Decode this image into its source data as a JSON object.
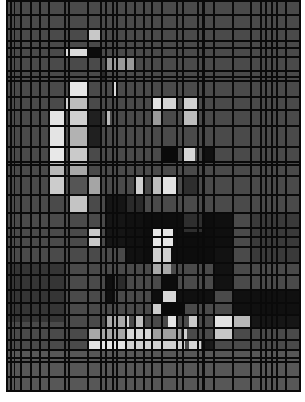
{
  "artwork": {
    "description": "Grayscale pixelated mosaic of a figure with an irregular black grid overlay",
    "background": "#4a4a4a",
    "grid_color": "#0a0a0a",
    "origin": [
      6,
      0
    ],
    "size": [
      295,
      392
    ],
    "vertical_lines": [
      {
        "x": 0,
        "w": 2
      },
      {
        "x": 4,
        "w": 2
      },
      {
        "x": 8,
        "w": 1
      },
      {
        "x": 14,
        "w": 2
      },
      {
        "x": 24,
        "w": 2
      },
      {
        "x": 33,
        "w": 2
      },
      {
        "x": 42,
        "w": 2
      },
      {
        "x": 58,
        "w": 2
      },
      {
        "x": 62,
        "w": 2
      },
      {
        "x": 81,
        "w": 2
      },
      {
        "x": 94,
        "w": 2
      },
      {
        "x": 99,
        "w": 2
      },
      {
        "x": 106,
        "w": 2
      },
      {
        "x": 110,
        "w": 2
      },
      {
        "x": 119,
        "w": 2
      },
      {
        "x": 128,
        "w": 2
      },
      {
        "x": 137,
        "w": 2
      },
      {
        "x": 145,
        "w": 2
      },
      {
        "x": 155,
        "w": 2
      },
      {
        "x": 170,
        "w": 2
      },
      {
        "x": 176,
        "w": 2
      },
      {
        "x": 191,
        "w": 2
      },
      {
        "x": 196,
        "w": 3
      },
      {
        "x": 207,
        "w": 2
      },
      {
        "x": 226,
        "w": 2
      },
      {
        "x": 244,
        "w": 2
      },
      {
        "x": 254,
        "w": 2
      },
      {
        "x": 259,
        "w": 2
      },
      {
        "x": 265,
        "w": 2
      },
      {
        "x": 270,
        "w": 2
      },
      {
        "x": 279,
        "w": 2
      },
      {
        "x": 293,
        "w": 2
      }
    ],
    "horizontal_lines": [
      {
        "y": 0,
        "h": 2
      },
      {
        "y": 14,
        "h": 2
      },
      {
        "y": 28,
        "h": 2
      },
      {
        "y": 40,
        "h": 2
      },
      {
        "y": 47,
        "h": 2
      },
      {
        "y": 56,
        "h": 2
      },
      {
        "y": 70,
        "h": 2
      },
      {
        "y": 76,
        "h": 2
      },
      {
        "y": 80,
        "h": 2
      },
      {
        "y": 96,
        "h": 2
      },
      {
        "y": 109,
        "h": 2
      },
      {
        "y": 125,
        "h": 2
      },
      {
        "y": 146,
        "h": 2
      },
      {
        "y": 161,
        "h": 2
      },
      {
        "y": 164,
        "h": 2
      },
      {
        "y": 175,
        "h": 2
      },
      {
        "y": 194,
        "h": 2
      },
      {
        "y": 212,
        "h": 2
      },
      {
        "y": 227,
        "h": 2
      },
      {
        "y": 236,
        "h": 2
      },
      {
        "y": 246,
        "h": 2
      },
      {
        "y": 262,
        "h": 2
      },
      {
        "y": 274,
        "h": 2
      },
      {
        "y": 289,
        "h": 2
      },
      {
        "y": 302,
        "h": 2
      },
      {
        "y": 314,
        "h": 2
      },
      {
        "y": 327,
        "h": 2
      },
      {
        "y": 339,
        "h": 2
      },
      {
        "y": 349,
        "h": 2
      },
      {
        "y": 357,
        "h": 2
      },
      {
        "y": 361,
        "h": 2
      },
      {
        "y": 376,
        "h": 2
      },
      {
        "y": 390,
        "h": 2
      }
    ],
    "blocks": [
      {
        "x": 82,
        "y": 28,
        "w": 12,
        "h": 12,
        "c": "#c8c8c8"
      },
      {
        "x": 58,
        "y": 47,
        "w": 24,
        "h": 9,
        "c": "#dcdcdc"
      },
      {
        "x": 82,
        "y": 47,
        "w": 12,
        "h": 9,
        "c": "#0c0c0c"
      },
      {
        "x": 99,
        "y": 58,
        "w": 30,
        "h": 12,
        "c": "#9a9a9a"
      },
      {
        "x": 94,
        "y": 70,
        "w": 5,
        "h": 10,
        "c": "#2a2a2a"
      },
      {
        "x": 64,
        "y": 80,
        "w": 17,
        "h": 16,
        "c": "#e6e6e6"
      },
      {
        "x": 58,
        "y": 96,
        "w": 6,
        "h": 13,
        "c": "#d0d0d0"
      },
      {
        "x": 64,
        "y": 96,
        "w": 17,
        "h": 13,
        "c": "#bdbdbd"
      },
      {
        "x": 106,
        "y": 80,
        "w": 5,
        "h": 16,
        "c": "#dadada"
      },
      {
        "x": 42,
        "y": 109,
        "w": 16,
        "h": 37,
        "c": "#e4e4e4"
      },
      {
        "x": 64,
        "y": 109,
        "w": 17,
        "h": 16,
        "c": "#cfcfcf"
      },
      {
        "x": 64,
        "y": 125,
        "w": 17,
        "h": 21,
        "c": "#b2b2b2"
      },
      {
        "x": 82,
        "y": 109,
        "w": 12,
        "h": 37,
        "c": "#202020"
      },
      {
        "x": 99,
        "y": 109,
        "w": 5,
        "h": 16,
        "c": "#bcbcbc"
      },
      {
        "x": 145,
        "y": 96,
        "w": 10,
        "h": 13,
        "c": "#e0e0e0"
      },
      {
        "x": 157,
        "y": 96,
        "w": 13,
        "h": 13,
        "c": "#d4d4d4"
      },
      {
        "x": 178,
        "y": 96,
        "w": 13,
        "h": 13,
        "c": "#cfcfcf"
      },
      {
        "x": 178,
        "y": 109,
        "w": 13,
        "h": 16,
        "c": "#bdbdbd"
      },
      {
        "x": 145,
        "y": 109,
        "w": 10,
        "h": 16,
        "c": "#9a9a9a"
      },
      {
        "x": 157,
        "y": 146,
        "w": 13,
        "h": 15,
        "c": "#0a0a0a"
      },
      {
        "x": 176,
        "y": 146,
        "w": 13,
        "h": 15,
        "c": "#d8d8d8"
      },
      {
        "x": 199,
        "y": 146,
        "w": 8,
        "h": 15,
        "c": "#111111"
      },
      {
        "x": 196,
        "y": 161,
        "w": 11,
        "h": 2,
        "c": "#e0e0e0"
      },
      {
        "x": 42,
        "y": 146,
        "w": 16,
        "h": 15,
        "c": "#e8e8e8"
      },
      {
        "x": 64,
        "y": 146,
        "w": 17,
        "h": 15,
        "c": "#cacaca"
      },
      {
        "x": 42,
        "y": 161,
        "w": 16,
        "h": 14,
        "c": "#b8b8b8"
      },
      {
        "x": 64,
        "y": 161,
        "w": 17,
        "h": 14,
        "c": "#a8a8a8"
      },
      {
        "x": 42,
        "y": 175,
        "w": 16,
        "h": 19,
        "c": "#cccccc"
      },
      {
        "x": 64,
        "y": 175,
        "w": 17,
        "h": 19,
        "c": "#555555"
      },
      {
        "x": 82,
        "y": 175,
        "w": 12,
        "h": 19,
        "c": "#a5a5a5"
      },
      {
        "x": 128,
        "y": 175,
        "w": 9,
        "h": 19,
        "c": "#d0d0d0"
      },
      {
        "x": 147,
        "y": 175,
        "w": 8,
        "h": 19,
        "c": "#bdbdbd"
      },
      {
        "x": 157,
        "y": 175,
        "w": 13,
        "h": 19,
        "c": "#e2e2e2"
      },
      {
        "x": 64,
        "y": 194,
        "w": 17,
        "h": 18,
        "c": "#c4c4c4"
      },
      {
        "x": 99,
        "y": 194,
        "w": 20,
        "h": 52,
        "c": "#151515"
      },
      {
        "x": 119,
        "y": 194,
        "w": 18,
        "h": 18,
        "c": "#2a2a2a"
      },
      {
        "x": 178,
        "y": 175,
        "w": 13,
        "h": 20,
        "c": "#2e2e2e"
      },
      {
        "x": 0,
        "y": 212,
        "w": 295,
        "h": 0,
        "c": "#4a4a4a"
      },
      {
        "x": 82,
        "y": 227,
        "w": 12,
        "h": 19,
        "c": "#c9c9c9"
      },
      {
        "x": 119,
        "y": 212,
        "w": 18,
        "h": 50,
        "c": "#111111"
      },
      {
        "x": 137,
        "y": 212,
        "w": 70,
        "h": 50,
        "c": "#0d0d0d"
      },
      {
        "x": 147,
        "y": 227,
        "w": 20,
        "h": 19,
        "c": "#e6e6e6"
      },
      {
        "x": 145,
        "y": 246,
        "w": 20,
        "h": 16,
        "c": "#cfcfcf"
      },
      {
        "x": 176,
        "y": 212,
        "w": 20,
        "h": 20,
        "c": "#2e2e2e"
      },
      {
        "x": 207,
        "y": 212,
        "w": 19,
        "h": 34,
        "c": "#0f0f0f"
      },
      {
        "x": 245,
        "y": 212,
        "w": 50,
        "h": 50,
        "c": "#3a3a3a"
      },
      {
        "x": 145,
        "y": 262,
        "w": 20,
        "h": 12,
        "c": "#a8a8a8"
      },
      {
        "x": 155,
        "y": 274,
        "w": 15,
        "h": 15,
        "c": "#0c0c0c"
      },
      {
        "x": 156,
        "y": 289,
        "w": 14,
        "h": 13,
        "c": "#d8d8d8"
      },
      {
        "x": 157,
        "y": 302,
        "w": 13,
        "h": 12,
        "c": "#c5c5c5"
      },
      {
        "x": 145,
        "y": 302,
        "w": 10,
        "h": 12,
        "c": "#cccccc"
      },
      {
        "x": 145,
        "y": 289,
        "w": 10,
        "h": 13,
        "c": "#0e0e0e"
      },
      {
        "x": 99,
        "y": 274,
        "w": 10,
        "h": 28,
        "c": "#0f0f0f"
      },
      {
        "x": 112,
        "y": 274,
        "w": 7,
        "h": 15,
        "c": "#2b2b2b"
      },
      {
        "x": 170,
        "y": 289,
        "w": 37,
        "h": 13,
        "c": "#101010"
      },
      {
        "x": 207,
        "y": 246,
        "w": 19,
        "h": 43,
        "c": "#121212"
      },
      {
        "x": 226,
        "y": 289,
        "w": 69,
        "h": 25,
        "c": "#101010"
      },
      {
        "x": 155,
        "y": 302,
        "w": 24,
        "h": 12,
        "c": "#0a0a0a"
      },
      {
        "x": 99,
        "y": 314,
        "w": 22,
        "h": 13,
        "c": "#a9a9a9"
      },
      {
        "x": 119,
        "y": 314,
        "w": 4,
        "h": 13,
        "c": "#d4d4d4"
      },
      {
        "x": 128,
        "y": 314,
        "w": 9,
        "h": 13,
        "c": "#bfbfbf"
      },
      {
        "x": 162,
        "y": 314,
        "w": 10,
        "h": 13,
        "c": "#e6e6e6"
      },
      {
        "x": 183,
        "y": 314,
        "w": 10,
        "h": 13,
        "c": "#cbcbcb"
      },
      {
        "x": 207,
        "y": 314,
        "w": 19,
        "h": 13,
        "c": "#e2e2e2"
      },
      {
        "x": 226,
        "y": 314,
        "w": 18,
        "h": 13,
        "c": "#b8b8b8"
      },
      {
        "x": 244,
        "y": 314,
        "w": 51,
        "h": 13,
        "c": "#161616"
      },
      {
        "x": 82,
        "y": 327,
        "w": 37,
        "h": 12,
        "c": "#a8a8a8"
      },
      {
        "x": 119,
        "y": 327,
        "w": 26,
        "h": 12,
        "c": "#d7d7d7"
      },
      {
        "x": 145,
        "y": 327,
        "w": 30,
        "h": 12,
        "c": "#a0a0a0"
      },
      {
        "x": 176,
        "y": 327,
        "w": 5,
        "h": 12,
        "c": "#d0d0d0"
      },
      {
        "x": 207,
        "y": 327,
        "w": 19,
        "h": 12,
        "c": "#c6c6c6"
      },
      {
        "x": 82,
        "y": 339,
        "w": 37,
        "h": 10,
        "c": "#e4e4e4"
      },
      {
        "x": 119,
        "y": 339,
        "w": 60,
        "h": 10,
        "c": "#cfcfcf"
      },
      {
        "x": 183,
        "y": 339,
        "w": 12,
        "h": 10,
        "c": "#d6d6d6"
      },
      {
        "x": 196,
        "y": 339,
        "w": 11,
        "h": 10,
        "c": "#1a1a1a"
      },
      {
        "x": 0,
        "y": 262,
        "w": 58,
        "h": 60,
        "c": "#353535"
      },
      {
        "x": 0,
        "y": 349,
        "w": 295,
        "h": 41,
        "c": "#575757"
      }
    ]
  }
}
